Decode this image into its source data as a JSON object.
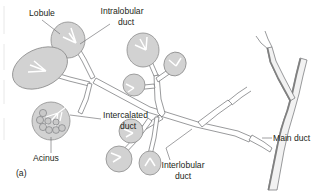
{
  "figure": {
    "panel_label": "(a)",
    "caption_subject": "branching duct system of a salivary gland",
    "background_color": "#ffffff",
    "lobule_fill_color": "#d2d2d2",
    "lobule_stroke_color": "#8d8d8d",
    "duct_stroke_color": "#6d6e71",
    "text_color": "#231f20"
  },
  "labels": {
    "lobule": {
      "text": "Lobule",
      "x": 22,
      "y": 16
    },
    "intralobular_duct": {
      "line1": "Intralobular",
      "line2": "duct",
      "x": 112,
      "y": 14
    },
    "intercalated_duct": {
      "line1": "Intercalated",
      "line2": "duct",
      "x": 103,
      "y": 115
    },
    "acinus": {
      "text": "Acinus",
      "x": 46,
      "y": 161
    },
    "interlobular_duct": {
      "line1": "Interlobular",
      "line2": "duct",
      "x": 183,
      "y": 167
    },
    "main_duct": {
      "text": "Main duct",
      "x": 273,
      "y": 141
    }
  },
  "structures": {
    "lobules": [
      {
        "name": "upper-left-lobule",
        "cx": 68,
        "cy": 40,
        "rx": 17,
        "ry": 18,
        "rotate": 0
      },
      {
        "name": "left-large-lobule",
        "cx": 40,
        "cy": 68,
        "rx": 29,
        "ry": 19,
        "rotate": -25
      },
      {
        "name": "center-top-lobule",
        "cx": 143,
        "cy": 50,
        "rx": 16,
        "ry": 17,
        "rotate": 0
      },
      {
        "name": "center-right-lobule",
        "cx": 175,
        "cy": 64,
        "rx": 11,
        "ry": 12,
        "rotate": 20
      },
      {
        "name": "center-left-lobule",
        "cx": 134,
        "cy": 85,
        "rx": 11,
        "ry": 11,
        "rotate": 0
      },
      {
        "name": "acinus-lobule",
        "cx": 51,
        "cy": 121,
        "rx": 19,
        "ry": 19,
        "rotate": 0
      },
      {
        "name": "lower-right-lobule",
        "cx": 131,
        "cy": 131,
        "rx": 12,
        "ry": 12,
        "rotate": 0
      },
      {
        "name": "lower-left-lobule",
        "cx": 119,
        "cy": 159,
        "rx": 13,
        "ry": 13,
        "rotate": 0
      },
      {
        "name": "lower-mid-lobule",
        "cx": 150,
        "cy": 163,
        "rx": 11,
        "ry": 12,
        "rotate": 0
      }
    ],
    "duct_names": [
      "main-duct",
      "interlobular-duct",
      "intralobular-duct",
      "intercalated-duct",
      "acinus"
    ]
  }
}
